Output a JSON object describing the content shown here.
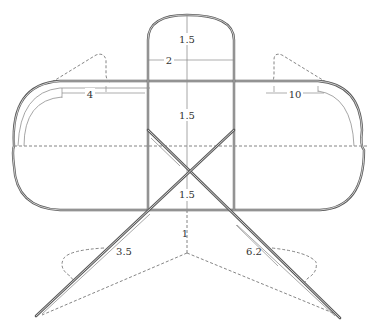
{
  "diagram": {
    "colors": {
      "outline": "#5a5a5a",
      "dimension": "#8a8a8a",
      "dashed": "#666666",
      "text": "#333333"
    },
    "labels": {
      "turret_height": "1.5",
      "turret_width": "2",
      "upper_panel_height": "1.5",
      "lower_panel_height": "1.5",
      "left_span": "4",
      "right_span": "10",
      "left_leg": "3.5",
      "right_leg": "6.2",
      "center_drop": "1"
    }
  }
}
